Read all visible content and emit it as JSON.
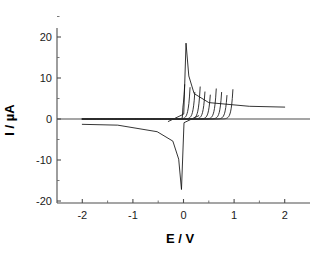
{
  "figure": {
    "kind": "cyclic-voltammogram",
    "background_color": "#ffffff",
    "trace_color": "#111111",
    "axis_color": "#4d4d4d"
  },
  "chart_data": {
    "type": "line",
    "title": "",
    "subtitle": "",
    "xlabel": "E / V",
    "ylabel": "I / µA",
    "xlim": [
      -2.5,
      2.5
    ],
    "ylim": [
      -20,
      25
    ],
    "grid": false,
    "legend": null,
    "legend_position": "none",
    "x_ticks": [
      -2,
      -1,
      0,
      1,
      2
    ],
    "x_tick_labels": [
      "-2",
      "-1",
      "0",
      "1",
      "2"
    ],
    "x_minor_ticks": [
      -1.5,
      -0.5,
      0.5,
      1.5
    ],
    "y_ticks": [
      -20,
      -10,
      0,
      10,
      20
    ],
    "y_tick_labels": [
      "-20",
      "-10",
      "0",
      "10",
      "20"
    ],
    "y_minor_ticks": [
      -15,
      -5,
      5,
      15
    ],
    "axis_origin_zero_line": 0,
    "n_curves": 10,
    "peak_anodic_max_uA": 18.5,
    "peak_cathodic_max_uA": -17.2,
    "peak_anodic_plateau_uA": 14.6,
    "peak_cathodic_plateau_uA": -11.5,
    "tail_current_positive_uA": 3.0,
    "tail_current_negative_uA": -1.3,
    "switching_potentials_v": [
      0.06,
      0.16,
      0.26,
      0.36,
      0.46,
      0.57,
      0.68,
      0.79,
      0.9,
      1.02
    ],
    "series": [
      {
        "name": "cycle-1",
        "switching_potential": 0.06,
        "anodic_peak_uA": 18.5,
        "anodic_peak_potential": 0.05,
        "cathodic_peak_uA": -17.2,
        "cathodic_peak_potential": -0.04
      },
      {
        "name": "cycle-2",
        "switching_potential": 0.16,
        "anodic_peak_uA": 14.2,
        "anodic_peak_potential": 0.15,
        "cathodic_peak_uA": -10.6,
        "cathodic_peak_potential": -0.14
      },
      {
        "name": "cycle-3",
        "switching_potential": 0.26,
        "anodic_peak_uA": 14.4,
        "anodic_peak_potential": 0.25,
        "cathodic_peak_uA": -11.0,
        "cathodic_peak_potential": -0.24
      },
      {
        "name": "cycle-4",
        "switching_potential": 0.36,
        "anodic_peak_uA": 14.5,
        "anodic_peak_potential": 0.35,
        "cathodic_peak_uA": -11.2,
        "cathodic_peak_potential": -0.34
      },
      {
        "name": "cycle-5",
        "switching_potential": 0.46,
        "anodic_peak_uA": 14.6,
        "anodic_peak_potential": 0.45,
        "cathodic_peak_uA": -11.3,
        "cathodic_peak_potential": -0.44
      },
      {
        "name": "cycle-6",
        "switching_potential": 0.57,
        "anodic_peak_uA": 14.6,
        "anodic_peak_potential": 0.56,
        "cathodic_peak_uA": -11.4,
        "cathodic_peak_potential": -0.55
      },
      {
        "name": "cycle-7",
        "switching_potential": 0.68,
        "anodic_peak_uA": 14.6,
        "anodic_peak_potential": 0.67,
        "cathodic_peak_uA": -11.5,
        "cathodic_peak_potential": -0.66
      },
      {
        "name": "cycle-8",
        "switching_potential": 0.79,
        "anodic_peak_uA": 14.6,
        "anodic_peak_potential": 0.78,
        "cathodic_peak_uA": -11.5,
        "cathodic_peak_potential": -0.77
      },
      {
        "name": "cycle-9",
        "switching_potential": 0.9,
        "anodic_peak_uA": 14.6,
        "anodic_peak_potential": 0.89,
        "cathodic_peak_uA": -11.5,
        "cathodic_peak_potential": -0.88
      },
      {
        "name": "cycle-10",
        "switching_potential": 1.02,
        "anodic_peak_uA": 14.5,
        "anodic_peak_potential": 1.0,
        "cathodic_peak_uA": -11.4,
        "cathodic_peak_potential": -0.99
      }
    ]
  }
}
